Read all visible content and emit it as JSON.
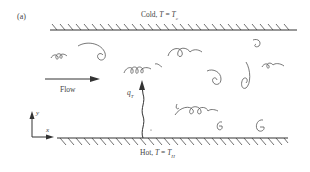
{
  "figure": {
    "panel_label": "(a)",
    "top_wall": {
      "label_prefix": "Cold, ",
      "var": "T",
      "eq": " = ",
      "value": "T",
      "subscript": "c"
    },
    "bottom_wall": {
      "label_prefix": "Hot, ",
      "var": "T",
      "eq": " = ",
      "value": "T",
      "subscript": "H"
    },
    "flow_label": "Flow",
    "heat_flux_label": "q",
    "heat_flux_subscript": "T",
    "axis_y": "y",
    "axis_x": "x",
    "colors": {
      "line": "#333333",
      "eddy": "#555555",
      "text": "#444444"
    }
  }
}
